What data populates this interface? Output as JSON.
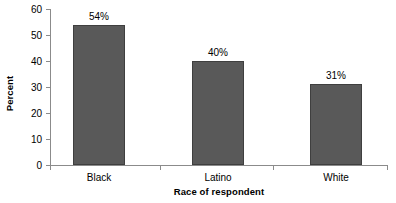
{
  "chart_data": {
    "type": "bar",
    "title": "",
    "subtitle": "",
    "xlabel": "Race of respondent",
    "ylabel": "Percent",
    "categories": [
      "Black",
      "Latino",
      "White"
    ],
    "values": [
      54,
      40,
      31
    ],
    "data_labels": [
      "54%",
      "40%",
      "31%"
    ],
    "ylim": [
      0,
      60
    ],
    "ytick_labels": [
      "60",
      "50",
      "40",
      "30",
      "20",
      "10",
      "0"
    ],
    "ytick_values": [
      60,
      50,
      40,
      30,
      20,
      10,
      0
    ],
    "ytick_step": 10,
    "grid": false,
    "legend": false,
    "legend_position": "none",
    "bar_color": "#595959",
    "bar_border_color": "#3f3f3f",
    "axis_color": "#8b8b8b",
    "text_color": "#000000",
    "background_color": "#ffffff"
  }
}
